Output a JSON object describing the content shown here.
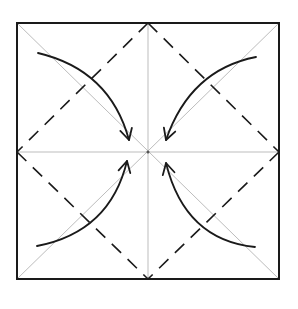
{
  "diagram": {
    "type": "origami-fold-diagram",
    "colors": {
      "background": "#ffffff",
      "outline": "#1a1a1a",
      "crease": "#bdbdbd",
      "valley_fold": "#1a1a1a",
      "arrow": "#1a1a1a"
    },
    "square": {
      "x1": 17,
      "y1": 23,
      "x2": 279,
      "y2": 279
    },
    "center": {
      "x": 148,
      "y": 152
    },
    "creases": [
      {
        "name": "diagonal-tl-br",
        "from": [
          17,
          23
        ],
        "to": [
          279,
          279
        ]
      },
      {
        "name": "diagonal-tr-bl",
        "from": [
          279,
          23
        ],
        "to": [
          17,
          279
        ]
      },
      {
        "name": "vertical-midline",
        "from": [
          148,
          23
        ],
        "to": [
          148,
          279
        ]
      },
      {
        "name": "horizontal-midline",
        "from": [
          17,
          152
        ],
        "to": [
          279,
          152
        ]
      }
    ],
    "valley_folds": [
      {
        "name": "fold-top-left",
        "from": [
          148,
          23
        ],
        "to": [
          17,
          152
        ]
      },
      {
        "name": "fold-top-right",
        "from": [
          148,
          23
        ],
        "to": [
          279,
          152
        ]
      },
      {
        "name": "fold-bottom-left",
        "from": [
          17,
          152
        ],
        "to": [
          148,
          279
        ]
      },
      {
        "name": "fold-bottom-right",
        "from": [
          279,
          152
        ],
        "to": [
          148,
          279
        ]
      }
    ],
    "arrows": [
      {
        "name": "arrow-top-left",
        "path": "M 38 53 Q 110 70 129 140",
        "head": [
          129,
          140
        ],
        "direction": "to-center"
      },
      {
        "name": "arrow-top-right",
        "path": "M 256 57 Q 190 70 166 140",
        "head": [
          166,
          140
        ],
        "direction": "to-center"
      },
      {
        "name": "arrow-bottom-left",
        "path": "M 37 246 Q 110 232 127 161",
        "head": [
          127,
          161
        ],
        "direction": "to-center"
      },
      {
        "name": "arrow-bottom-right",
        "path": "M 255 247 Q 185 240 166 163",
        "head": [
          166,
          163
        ],
        "direction": "to-center"
      }
    ]
  }
}
